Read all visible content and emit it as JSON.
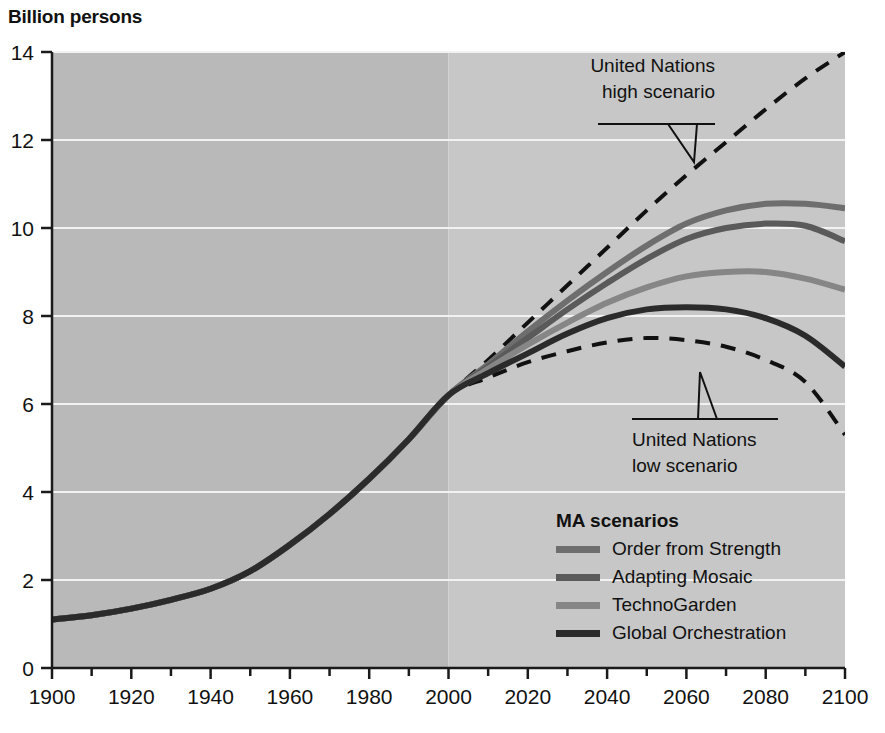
{
  "axis_title": "Billion persons",
  "legend": {
    "title": "MA scenarios",
    "items": [
      {
        "label": "Order from Strength",
        "color": "#6e6e6e"
      },
      {
        "label": "Adapting Mosaic",
        "color": "#5a5a5a"
      },
      {
        "label": "TechnoGarden",
        "color": "#868686"
      },
      {
        "label": "Global Orchestration",
        "color": "#2b2b2b"
      }
    ]
  },
  "annotations": [
    {
      "id": "un-high",
      "line1": "United Nations",
      "line2": "high scenario"
    },
    {
      "id": "un-low",
      "line1": "United Nations",
      "line2": "low scenario"
    }
  ],
  "style": {
    "plot_bg_left": "#b9b9b9",
    "plot_bg_right": "#c7c7c7",
    "gridline_color": "#f2f2f2",
    "axis_color": "#1a1a1a",
    "dashed_color": "#111111"
  },
  "chart_data": {
    "type": "line",
    "title": "Billion persons",
    "xlabel": "",
    "ylabel": "Billion persons",
    "xlim": [
      1900,
      2100
    ],
    "ylim": [
      0,
      14
    ],
    "yticks": [
      0,
      2,
      4,
      6,
      8,
      10,
      12,
      14
    ],
    "xticks": [
      1900,
      1920,
      1940,
      1960,
      1980,
      2000,
      2020,
      2040,
      2060,
      2080,
      2100
    ],
    "xminor_step": 10,
    "grid": "horizontal-white",
    "legend_position": "inside-lower-right",
    "historical_split_year": 2000,
    "x": [
      1900,
      1910,
      1920,
      1930,
      1940,
      1950,
      1960,
      1970,
      1980,
      1990,
      2000,
      2010,
      2020,
      2030,
      2040,
      2050,
      2060,
      2070,
      2080,
      2090,
      2100
    ],
    "series": [
      {
        "name": "United Nations high scenario",
        "style": "dashed",
        "color": "#111111",
        "values": [
          1.1,
          1.2,
          1.35,
          1.55,
          1.8,
          2.2,
          2.8,
          3.5,
          4.3,
          5.2,
          6.2,
          7.0,
          7.85,
          8.7,
          9.55,
          10.4,
          11.2,
          11.95,
          12.7,
          13.4,
          14.0
        ]
      },
      {
        "name": "United Nations low scenario",
        "style": "dashed",
        "color": "#111111",
        "values": [
          1.1,
          1.2,
          1.35,
          1.55,
          1.8,
          2.2,
          2.8,
          3.5,
          4.3,
          5.2,
          6.2,
          6.6,
          6.95,
          7.2,
          7.4,
          7.5,
          7.45,
          7.3,
          7.0,
          6.5,
          5.3
        ]
      },
      {
        "name": "Order from Strength",
        "style": "solid",
        "color": "#6e6e6e",
        "values": [
          1.1,
          1.2,
          1.35,
          1.55,
          1.8,
          2.2,
          2.8,
          3.5,
          4.3,
          5.2,
          6.2,
          6.9,
          7.65,
          8.35,
          9.0,
          9.6,
          10.1,
          10.4,
          10.55,
          10.55,
          10.45
        ]
      },
      {
        "name": "Adapting Mosaic",
        "style": "solid",
        "color": "#5a5a5a",
        "values": [
          1.1,
          1.2,
          1.35,
          1.55,
          1.8,
          2.2,
          2.8,
          3.5,
          4.3,
          5.2,
          6.2,
          6.85,
          7.5,
          8.15,
          8.75,
          9.3,
          9.75,
          10.0,
          10.1,
          10.05,
          9.7
        ]
      },
      {
        "name": "TechnoGarden",
        "style": "solid",
        "color": "#868686",
        "values": [
          1.1,
          1.2,
          1.35,
          1.55,
          1.8,
          2.2,
          2.8,
          3.5,
          4.3,
          5.2,
          6.2,
          6.8,
          7.35,
          7.85,
          8.3,
          8.65,
          8.9,
          9.0,
          9.0,
          8.85,
          8.6
        ]
      },
      {
        "name": "Global Orchestration",
        "style": "solid",
        "color": "#2b2b2b",
        "values": [
          1.1,
          1.2,
          1.35,
          1.55,
          1.8,
          2.2,
          2.8,
          3.5,
          4.3,
          5.2,
          6.2,
          6.7,
          7.15,
          7.6,
          7.95,
          8.15,
          8.2,
          8.15,
          7.95,
          7.55,
          6.85
        ]
      }
    ]
  }
}
